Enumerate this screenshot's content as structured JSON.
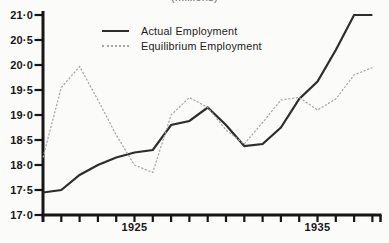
{
  "figure": {
    "title_clipped": "(millions)"
  },
  "legend": {
    "items": [
      {
        "label": "Actual Employment",
        "line_style": "solid",
        "color": "#2d2d2d"
      },
      {
        "label": "Equilibrium Employment",
        "line_style": "dotted",
        "color": "#a4a4a4"
      }
    ]
  },
  "axes": {
    "y_tick_labels": [
      "21·0",
      "20·5",
      "20·0",
      "19·5",
      "19·0",
      "18·5",
      "18·0",
      "17·5",
      "17·0"
    ],
    "x_tick_labels": [
      "1925",
      "1935"
    ]
  },
  "chart_data": {
    "type": "line",
    "title": "(millions)",
    "xlabel": "",
    "ylabel": "",
    "x": [
      1920,
      1921,
      1922,
      1923,
      1924,
      1925,
      1926,
      1927,
      1928,
      1929,
      1930,
      1931,
      1932,
      1933,
      1934,
      1935,
      1936,
      1937,
      1938
    ],
    "series": [
      {
        "name": "Actual Employment",
        "style": "solid",
        "color": "#2d2d2d",
        "values": [
          17.45,
          17.5,
          17.8,
          18.0,
          18.15,
          18.25,
          18.3,
          18.8,
          18.88,
          19.15,
          18.8,
          18.38,
          18.42,
          18.75,
          19.32,
          19.67,
          20.3,
          21.0,
          21.0
        ]
      },
      {
        "name": "Equilibrium Employment",
        "style": "dotted",
        "color": "#a4a4a4",
        "values": [
          18.15,
          19.55,
          19.97,
          19.3,
          18.6,
          18.0,
          17.85,
          19.0,
          19.35,
          19.15,
          18.7,
          18.42,
          18.85,
          19.3,
          19.35,
          19.1,
          19.32,
          19.8,
          19.95
        ]
      }
    ],
    "ylim": [
      17.0,
      21.0
    ],
    "ytick_step": 0.5,
    "x_labeled_ticks": [
      1925,
      1935
    ],
    "x_tick_every_year": true,
    "grid": false,
    "legend_position": "top-left-inside"
  }
}
